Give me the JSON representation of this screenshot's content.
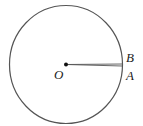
{
  "diagram": {
    "type": "geometry-circle",
    "center_label": "O",
    "points": [
      {
        "label": "B",
        "position": "on circle, slightly above A"
      },
      {
        "label": "A",
        "position": "on circle, right side"
      }
    ],
    "segments": [
      "OA",
      "OB"
    ],
    "colors": {
      "stroke": "#555555",
      "point": "#111111",
      "text": "#222222"
    }
  }
}
